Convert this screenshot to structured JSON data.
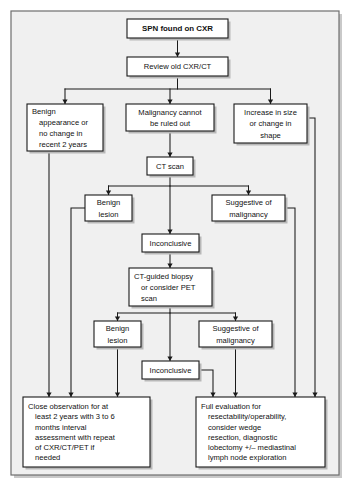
{
  "diagram": {
    "frame": {
      "fill": "#f0f0f0",
      "stroke": "#6e6e6e"
    },
    "node_style": {
      "fill": "#ffffff",
      "stroke": "#1a1a1a"
    },
    "connector_color": "#1a1a1a"
  },
  "nodes": [
    {
      "id": "spn",
      "name": "spn-found-on-cxr",
      "bold": true,
      "align": "center",
      "x": 127,
      "y": 19,
      "w": 101,
      "h": 19,
      "lines": [
        "SPN found on CXR"
      ]
    },
    {
      "id": "review",
      "name": "review-old-cxr-ct",
      "bold": false,
      "align": "center",
      "x": 127,
      "y": 57,
      "w": 101,
      "h": 19,
      "lines": [
        "Review old CXR/CT"
      ]
    },
    {
      "id": "benign-appearance",
      "name": "benign-appearance-or-no-change",
      "bold": false,
      "align": "hang",
      "x": 27,
      "y": 104,
      "w": 76,
      "h": 47,
      "lines": [
        "Benign",
        "appearance or",
        "no change in",
        "recent 2 years"
      ]
    },
    {
      "id": "malignancy-cannot",
      "name": "malignancy-cannot-be-ruled-out",
      "bold": false,
      "align": "center",
      "x": 126,
      "y": 104,
      "w": 88,
      "h": 27,
      "lines": [
        "Malignancy cannot",
        "be ruled out"
      ]
    },
    {
      "id": "increase-size",
      "name": "increase-in-size-or-change-in-shape",
      "bold": false,
      "align": "center",
      "x": 234,
      "y": 104,
      "w": 73,
      "h": 39,
      "lines": [
        "Increase in size",
        "or change in",
        "shape"
      ]
    },
    {
      "id": "ct-scan",
      "name": "ct-scan",
      "bold": false,
      "align": "center",
      "x": 147,
      "y": 157,
      "w": 46,
      "h": 18,
      "lines": [
        "CT scan"
      ]
    },
    {
      "id": "benign-lesion-1",
      "name": "benign-lesion-ct",
      "bold": false,
      "align": "center",
      "x": 85,
      "y": 195,
      "w": 47,
      "h": 26,
      "lines": [
        "Benign",
        "lesion"
      ]
    },
    {
      "id": "suggestive-1",
      "name": "suggestive-of-malignancy-ct",
      "bold": false,
      "align": "center",
      "x": 212,
      "y": 195,
      "w": 73,
      "h": 26,
      "lines": [
        "Suggestive of",
        "malignancy"
      ]
    },
    {
      "id": "inconclusive-1",
      "name": "inconclusive-ct",
      "bold": false,
      "align": "center",
      "x": 142,
      "y": 234,
      "w": 57,
      "h": 18,
      "lines": [
        "Inconclusive"
      ]
    },
    {
      "id": "biopsy",
      "name": "ct-guided-biopsy-or-pet",
      "bold": false,
      "align": "hang",
      "x": 129,
      "y": 268,
      "w": 83,
      "h": 38,
      "lines": [
        "CT-guided biopsy",
        "or consider PET",
        "scan"
      ]
    },
    {
      "id": "benign-lesion-2",
      "name": "benign-lesion-biopsy",
      "bold": false,
      "align": "center",
      "x": 94,
      "y": 321,
      "w": 47,
      "h": 26,
      "lines": [
        "Benign",
        "lesion"
      ]
    },
    {
      "id": "suggestive-2",
      "name": "suggestive-of-malignancy-biopsy",
      "bold": false,
      "align": "center",
      "x": 199,
      "y": 321,
      "w": 73,
      "h": 26,
      "lines": [
        "Suggestive of",
        "malignancy"
      ]
    },
    {
      "id": "inconclusive-2",
      "name": "inconclusive-biopsy",
      "bold": false,
      "align": "center",
      "x": 142,
      "y": 361,
      "w": 57,
      "h": 18,
      "lines": [
        "Inconclusive"
      ]
    },
    {
      "id": "close-observation",
      "name": "close-observation-outcome",
      "bold": false,
      "align": "hang",
      "x": 23,
      "y": 397,
      "w": 127,
      "h": 70,
      "lines": [
        "Close observation for at",
        "least 2 years with 3 to 6",
        "months interval",
        "assessment with repeat",
        "of CXR/CT/PET if",
        "needed"
      ]
    },
    {
      "id": "full-evaluation",
      "name": "full-evaluation-outcome",
      "bold": false,
      "align": "hang",
      "x": 196,
      "y": 397,
      "w": 129,
      "h": 70,
      "lines": [
        "Full evaluation for",
        "resectability/operability,",
        "consider wedge",
        "resection, diagnostic",
        "lobectomy +/– mediastinal",
        "lymph node exploration"
      ]
    }
  ],
  "connectors": [
    {
      "name": "spn-to-review",
      "points": "177.5,38 177.5,57",
      "arrow": "down",
      "ax": 177.5,
      "ay": 57
    },
    {
      "name": "review-to-fanout",
      "points": "177.5,76 177.5,89",
      "arrow": "none"
    },
    {
      "name": "fanout-bus",
      "points": "65,89 270.5,89",
      "arrow": "none"
    },
    {
      "name": "fanout-left",
      "points": "65,89 65,104",
      "arrow": "down",
      "ax": 65,
      "ay": 104
    },
    {
      "name": "fanout-mid",
      "points": "170,89 170,104",
      "arrow": "down",
      "ax": 170,
      "ay": 104
    },
    {
      "name": "fanout-right",
      "points": "270.5,89 270.5,104",
      "arrow": "down",
      "ax": 270.5,
      "ay": 104
    },
    {
      "name": "malignancy-to-ct",
      "points": "170,131 170,157",
      "arrow": "down",
      "ax": 170,
      "ay": 157
    },
    {
      "name": "ct-to-fanout",
      "points": "170,175 170,186",
      "arrow": "none"
    },
    {
      "name": "ct-branch-bus",
      "points": "108.5,186 248.5,186",
      "arrow": "none"
    },
    {
      "name": "ct-branch-left",
      "points": "108.5,186 108.5,195",
      "arrow": "down",
      "ax": 108.5,
      "ay": 195
    },
    {
      "name": "ct-branch-mid",
      "points": "170,186 170,234",
      "arrow": "down",
      "ax": 170,
      "ay": 234
    },
    {
      "name": "ct-branch-right",
      "points": "248.5,186 248.5,195",
      "arrow": "down",
      "ax": 248.5,
      "ay": 195
    },
    {
      "name": "inconclusive1-to-biopsy",
      "points": "170,252 170,268",
      "arrow": "down",
      "ax": 170,
      "ay": 268
    },
    {
      "name": "biopsy-to-fanout",
      "points": "170,306 170,313",
      "arrow": "none"
    },
    {
      "name": "biopsy-branch-bus",
      "points": "117.5,313 235.5,313",
      "arrow": "none"
    },
    {
      "name": "biopsy-branch-left",
      "points": "117.5,313 117.5,321",
      "arrow": "down",
      "ax": 117.5,
      "ay": 321
    },
    {
      "name": "biopsy-branch-mid",
      "points": "170,313 170,361",
      "arrow": "down",
      "ax": 170,
      "ay": 361
    },
    {
      "name": "biopsy-branch-right",
      "points": "235.5,313 235.5,321",
      "arrow": "down",
      "ax": 235.5,
      "ay": 321
    },
    {
      "name": "benign-appearance-to-outcome",
      "points": "49,151 49,397",
      "arrow": "down",
      "ax": 49,
      "ay": 397
    },
    {
      "name": "benign-lesion1-to-outcome",
      "points": "85,208 71,208 71,397",
      "arrow": "down",
      "ax": 71,
      "ay": 397
    },
    {
      "name": "benign-lesion2-to-outcome",
      "points": "117.5,347 117.5,397",
      "arrow": "down",
      "ax": 117.5,
      "ay": 397
    },
    {
      "name": "inconclusive2-to-full-eval",
      "points": "199,370 213,370 213,397",
      "arrow": "down",
      "ax": 213,
      "ay": 397
    },
    {
      "name": "suggestive2-to-full-eval",
      "points": "235.5,347 235.5,397",
      "arrow": "down",
      "ax": 235.5,
      "ay": 397
    },
    {
      "name": "suggestive1-to-full-eval",
      "points": "285,208 295,208 295,397",
      "arrow": "down",
      "ax": 295,
      "ay": 397
    },
    {
      "name": "increase-size-to-full-eval",
      "points": "307,118 315,118 315,397",
      "arrow": "down",
      "ax": 315,
      "ay": 397
    }
  ]
}
